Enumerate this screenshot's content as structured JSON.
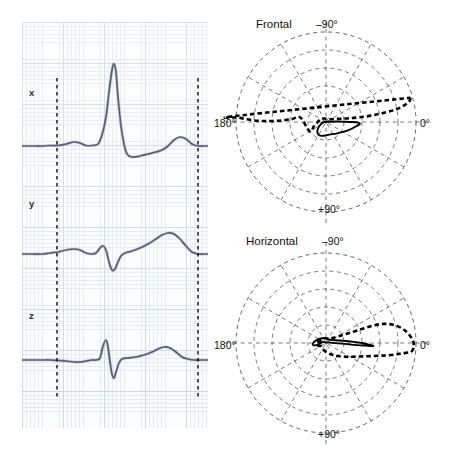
{
  "figure": {
    "type": "vectorcardiogram",
    "panels": [
      "ecg-traces",
      "frontal-polar",
      "horizontal-polar"
    ]
  },
  "ecg": {
    "lead_labels": {
      "x": "x",
      "y": "y",
      "z": "z"
    },
    "grid": {
      "fine_color": "#dfe8ef",
      "coarse_color": "#c4d2dd",
      "background": "#fbfdfd",
      "fine_spacing_px": 4.1,
      "coarse_spacing_px": 20.5
    },
    "trace_color": "#555f77",
    "marker_color": "#1a1a1a",
    "markers": [
      {
        "name": "qrs-onset-marker",
        "x_px": 35
      },
      {
        "name": "t-end-marker",
        "x_px": 176
      }
    ]
  },
  "polar": {
    "grid_color": "#4a4a4a",
    "loop_color": "#000000",
    "rings": 5,
    "spokes": 12,
    "spoke_step_deg": 30,
    "frontal": {
      "title": "Frontal",
      "labels": {
        "top": "–90°",
        "left": "180°",
        "right": "0°",
        "bottom": "+90°"
      }
    },
    "horizontal": {
      "title": "Horizontal",
      "labels": {
        "top": "–90°",
        "left": "180°",
        "right": "0°",
        "bottom": "+90°"
      }
    }
  },
  "chart_data": {
    "type": "line",
    "title": "",
    "xlabel": "",
    "ylabel": "",
    "series": [
      {
        "name": "x",
        "baseline_y_px": 124,
        "points_px": [
          [
            0,
            124
          ],
          [
            10,
            124
          ],
          [
            20,
            124
          ],
          [
            28,
            123.5
          ],
          [
            36,
            123.5
          ],
          [
            44,
            122
          ],
          [
            52,
            120
          ],
          [
            58,
            121
          ],
          [
            64,
            123.5
          ],
          [
            70,
            123.5
          ],
          [
            76,
            122
          ],
          [
            80,
            113
          ],
          [
            84,
            95
          ],
          [
            87,
            70
          ],
          [
            90,
            48
          ],
          [
            92,
            42
          ],
          [
            94,
            50
          ],
          [
            96,
            75
          ],
          [
            99,
            104
          ],
          [
            102,
            122
          ],
          [
            105,
            132
          ],
          [
            110,
            135
          ],
          [
            118,
            134
          ],
          [
            126,
            132
          ],
          [
            134,
            130
          ],
          [
            140,
            128
          ],
          [
            146,
            124
          ],
          [
            152,
            118
          ],
          [
            158,
            115
          ],
          [
            164,
            117
          ],
          [
            170,
            122
          ],
          [
            176,
            124
          ],
          [
            182,
            124
          ],
          [
            186,
            124
          ]
        ]
      },
      {
        "name": "y",
        "baseline_y_px": 232,
        "points_px": [
          [
            0,
            232
          ],
          [
            10,
            232
          ],
          [
            20,
            232
          ],
          [
            28,
            231
          ],
          [
            36,
            230
          ],
          [
            44,
            228
          ],
          [
            52,
            227
          ],
          [
            58,
            228
          ],
          [
            64,
            231
          ],
          [
            70,
            232
          ],
          [
            74,
            231
          ],
          [
            78,
            226
          ],
          [
            81,
            224
          ],
          [
            84,
            228
          ],
          [
            87,
            240
          ],
          [
            90,
            248
          ],
          [
            93,
            247
          ],
          [
            96,
            240
          ],
          [
            99,
            234
          ],
          [
            103,
            231
          ],
          [
            110,
            229
          ],
          [
            118,
            226
          ],
          [
            126,
            222
          ],
          [
            134,
            217
          ],
          [
            140,
            213
          ],
          [
            146,
            211
          ],
          [
            152,
            212
          ],
          [
            158,
            217
          ],
          [
            164,
            224
          ],
          [
            170,
            230
          ],
          [
            176,
            232
          ],
          [
            182,
            232
          ],
          [
            186,
            232
          ]
        ]
      },
      {
        "name": "z",
        "baseline_y_px": 338,
        "points_px": [
          [
            0,
            338
          ],
          [
            10,
            338
          ],
          [
            20,
            338
          ],
          [
            28,
            338
          ],
          [
            36,
            338.5
          ],
          [
            44,
            339
          ],
          [
            52,
            340
          ],
          [
            58,
            340
          ],
          [
            64,
            339
          ],
          [
            70,
            338
          ],
          [
            74,
            338
          ],
          [
            78,
            336
          ],
          [
            81,
            324
          ],
          [
            84,
            318
          ],
          [
            86,
            325
          ],
          [
            88,
            340
          ],
          [
            90,
            352
          ],
          [
            92,
            356
          ],
          [
            94,
            350
          ],
          [
            97,
            341
          ],
          [
            100,
            337
          ],
          [
            106,
            336
          ],
          [
            114,
            335
          ],
          [
            122,
            333
          ],
          [
            130,
            330
          ],
          [
            136,
            327
          ],
          [
            142,
            325
          ],
          [
            148,
            326
          ],
          [
            154,
            330
          ],
          [
            160,
            335
          ],
          [
            166,
            337
          ],
          [
            172,
            338
          ],
          [
            180,
            338
          ],
          [
            186,
            338
          ]
        ]
      }
    ],
    "frontal_loop": {
      "type": "polar-loop",
      "plane": "frontal",
      "angle_range_deg": [
        -180,
        180
      ],
      "center_px": [
        104,
        108
      ],
      "ring_radii_px": [
        18,
        36,
        54,
        72,
        90
      ],
      "qrs_loop_dashed_polar": [
        [
          -16,
          88
        ],
        [
          -14,
          86
        ],
        [
          -12,
          80
        ],
        [
          -10,
          70
        ],
        [
          -9,
          58
        ],
        [
          -8,
          46
        ],
        [
          -8,
          34
        ],
        [
          -9,
          24
        ],
        [
          -12,
          16
        ],
        [
          -18,
          10
        ],
        [
          -28,
          6
        ],
        [
          -45,
          4
        ],
        [
          -80,
          3
        ],
        [
          -120,
          4
        ],
        [
          -150,
          6
        ],
        [
          175,
          9
        ],
        [
          160,
          13
        ],
        [
          150,
          19
        ],
        [
          -170,
          26
        ],
        [
          -175,
          34
        ],
        [
          -178,
          44
        ],
        [
          -179,
          56
        ],
        [
          -179,
          68
        ],
        [
          -178,
          80
        ],
        [
          -177,
          87
        ],
        [
          -176,
          89
        ]
      ],
      "t_loop_solid_polar": [
        [
          -5,
          3
        ],
        [
          -3,
          10
        ],
        [
          -1,
          18
        ],
        [
          0,
          26
        ],
        [
          1,
          32
        ],
        [
          3,
          34
        ],
        [
          6,
          32
        ],
        [
          20,
          24
        ],
        [
          45,
          16
        ],
        [
          75,
          13
        ],
        [
          100,
          14
        ],
        [
          118,
          15
        ],
        [
          132,
          13
        ],
        [
          145,
          9
        ],
        [
          160,
          5
        ],
        [
          175,
          3
        ]
      ]
    },
    "horizontal_loop": {
      "type": "polar-loop",
      "plane": "horizontal",
      "angle_range_deg": [
        -180,
        180
      ],
      "center_px": [
        104,
        112
      ],
      "ring_radii_px": [
        18,
        36,
        54,
        72,
        90
      ],
      "qrs_loop_dashed_polar": [
        [
          6,
          86
        ],
        [
          2,
          88
        ],
        [
          -3,
          86
        ],
        [
          -9,
          80
        ],
        [
          -14,
          72
        ],
        [
          -18,
          62
        ],
        [
          -20,
          52
        ],
        [
          -21,
          42
        ],
        [
          -22,
          32
        ],
        [
          -24,
          22
        ],
        [
          -28,
          14
        ],
        [
          -38,
          8
        ],
        [
          -60,
          5
        ],
        [
          -110,
          5
        ],
        [
          -160,
          7
        ],
        [
          170,
          9
        ],
        [
          160,
          8
        ],
        [
          150,
          6
        ],
        [
          130,
          6
        ],
        [
          100,
          8
        ],
        [
          60,
          14
        ],
        [
          35,
          24
        ],
        [
          22,
          36
        ],
        [
          15,
          50
        ],
        [
          11,
          64
        ],
        [
          8,
          76
        ]
      ],
      "t_loop_solid_polar": [
        [
          -170,
          8
        ],
        [
          -175,
          6
        ],
        [
          178,
          5
        ],
        [
          172,
          7
        ],
        [
          168,
          10
        ],
        [
          170,
          13
        ],
        [
          178,
          13
        ],
        [
          -170,
          11
        ],
        [
          -150,
          8
        ],
        [
          -100,
          5
        ],
        [
          -40,
          5
        ],
        [
          -10,
          14
        ],
        [
          -3,
          26
        ],
        [
          0,
          36
        ],
        [
          2,
          42
        ],
        [
          4,
          44
        ]
      ]
    }
  }
}
